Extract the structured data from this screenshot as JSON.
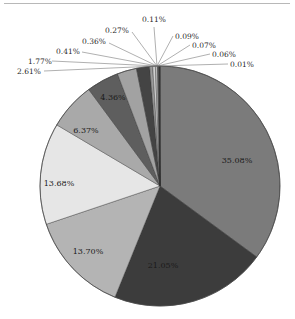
{
  "chart_data": {
    "type": "pie",
    "title": "",
    "start_angle_deg": 0,
    "direction": "clockwise",
    "slices": [
      {
        "label": "35.08%",
        "value": 35.08,
        "color": "#7b7b7b",
        "label_pos": "inside"
      },
      {
        "label": "21.05%",
        "value": 21.05,
        "color": "#3c3c3c",
        "label_pos": "inside"
      },
      {
        "label": "13.70%",
        "value": 13.7,
        "color": "#b4b4b4",
        "label_pos": "inside"
      },
      {
        "label": "13.68%",
        "value": 13.68,
        "color": "#e6e6e6",
        "label_pos": "inside"
      },
      {
        "label": "6.37%",
        "value": 6.37,
        "color": "#a9a9a9",
        "label_pos": "inside"
      },
      {
        "label": "4.36%",
        "value": 4.36,
        "color": "#5e5e5e",
        "label_pos": "inside"
      },
      {
        "label": "2.61%",
        "value": 2.61,
        "color": "#a2a2a2",
        "label_pos": "outside"
      },
      {
        "label": "1.77%",
        "value": 1.77,
        "color": "#444444",
        "label_pos": "outside"
      },
      {
        "label": "0.41%",
        "value": 0.41,
        "color": "#9a9a9a",
        "label_pos": "outside"
      },
      {
        "label": "0.36%",
        "value": 0.36,
        "color": "#cfcfcf",
        "label_pos": "outside"
      },
      {
        "label": "0.27%",
        "value": 0.27,
        "color": "#bdbdbd",
        "label_pos": "outside"
      },
      {
        "label": "0.11%",
        "value": 0.11,
        "color": "#888888",
        "label_pos": "outside"
      },
      {
        "label": "0.09%",
        "value": 0.09,
        "color": "#6a6a6a",
        "label_pos": "outside"
      },
      {
        "label": "0.07%",
        "value": 0.07,
        "color": "#555555",
        "label_pos": "outside"
      },
      {
        "label": "0.06%",
        "value": 0.06,
        "color": "#222222",
        "label_pos": "outside"
      },
      {
        "label": "0.01%",
        "value": 0.01,
        "color": "#111111",
        "label_pos": "outside"
      }
    ],
    "outside_labels": [
      {
        "label": "0.11%",
        "x": 142,
        "y": 22,
        "anchor": "start",
        "lx": 154,
        "ly": 27
      },
      {
        "label": "0.27%",
        "x": 105,
        "y": 33,
        "anchor": "start",
        "lx": 132,
        "ly": 32
      },
      {
        "label": "0.36%",
        "x": 82,
        "y": 44,
        "anchor": "start",
        "lx": 109,
        "ly": 43
      },
      {
        "label": "0.41%",
        "x": 56,
        "y": 54,
        "anchor": "start",
        "lx": 82,
        "ly": 52
      },
      {
        "label": "1.77%",
        "x": 28,
        "y": 64,
        "anchor": "start",
        "lx": 52,
        "ly": 61
      },
      {
        "label": "2.61%",
        "x": 17,
        "y": 74,
        "anchor": "start",
        "lx": 44,
        "ly": 71
      },
      {
        "label": "0.09%",
        "x": 175,
        "y": 39,
        "anchor": "start",
        "lx": 173,
        "ly": 36
      },
      {
        "label": "0.07%",
        "x": 192,
        "y": 48,
        "anchor": "start",
        "lx": 190,
        "ly": 45
      },
      {
        "label": "0.06%",
        "x": 212,
        "y": 57,
        "anchor": "start",
        "lx": 210,
        "ly": 54
      },
      {
        "label": "0.01%",
        "x": 230,
        "y": 67,
        "anchor": "start",
        "lx": 228,
        "ly": 64
      }
    ],
    "inside_labels": [
      {
        "label": "35.08%",
        "x": 237,
        "y": 163
      },
      {
        "label": "21.05%",
        "x": 163,
        "y": 268
      },
      {
        "label": "13.70%",
        "x": 88,
        "y": 254
      },
      {
        "label": "13.68%",
        "x": 59,
        "y": 186
      },
      {
        "label": "6.37%",
        "x": 86,
        "y": 133
      },
      {
        "label": "4.36%",
        "x": 113,
        "y": 100
      }
    ],
    "layout": {
      "cx": 160,
      "cy": 186,
      "r": 120,
      "label_hub_x": 157,
      "label_hub_y": 66,
      "legend": "none",
      "grid": false
    }
  }
}
